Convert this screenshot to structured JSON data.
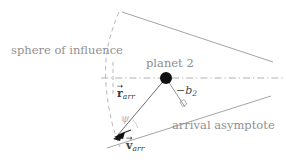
{
  "figure": {
    "width": 286,
    "height": 163,
    "background_color": "#ffffff"
  },
  "labels": {
    "sphere_of_influence": "sphere of influence",
    "planet_2": "planet 2",
    "arrival_asymptote": "arrival asymptote",
    "impact_parameter_sign": "−",
    "impact_parameter_var": "b",
    "impact_parameter_sub": "2",
    "r_arr_symbol": "r",
    "r_arr_sub": "arr",
    "v_arr_symbol": "v",
    "v_arr_sub": "arr",
    "psi_angle": "ψ"
  },
  "colors": {
    "solid_line": "#9a9a9a",
    "dashed_line": "#a8a8a8",
    "dashed_arc": "#b0b0b0",
    "planet_dot": "#111111",
    "vector_line": "#3a3a3a",
    "text_gray": "#8d8d8d",
    "text_dark": "#3a3a3a",
    "psi_gray": "#b4b4b4"
  },
  "geometry": {
    "planet_center": {
      "x": 166,
      "y": 78
    },
    "planet_radius": 6,
    "periapsis_vertex": {
      "x": 114,
      "y": 139
    },
    "asymptote_crossing": {
      "x": 232,
      "y": 78
    },
    "horizontal_axis_y": 78,
    "horizontal_axis_x_start": 101,
    "horizontal_axis_x_end": 284,
    "soi_arc_top": {
      "x": 119,
      "y": 12
    },
    "soi_arc_bottom": {
      "x": 120,
      "y": 147
    },
    "soi_arc_leftmost_x": 106,
    "upper_asymptote_start": {
      "x": 122,
      "y": 12
    },
    "upper_asymptote_end": {
      "x": 273,
      "y": 62
    },
    "lower_asymptote_start": {
      "x": 107,
      "y": 148
    },
    "lower_asymptote_end": {
      "x": 271,
      "y": 96
    },
    "right_angle_foot": {
      "x": 184,
      "y": 107
    }
  }
}
